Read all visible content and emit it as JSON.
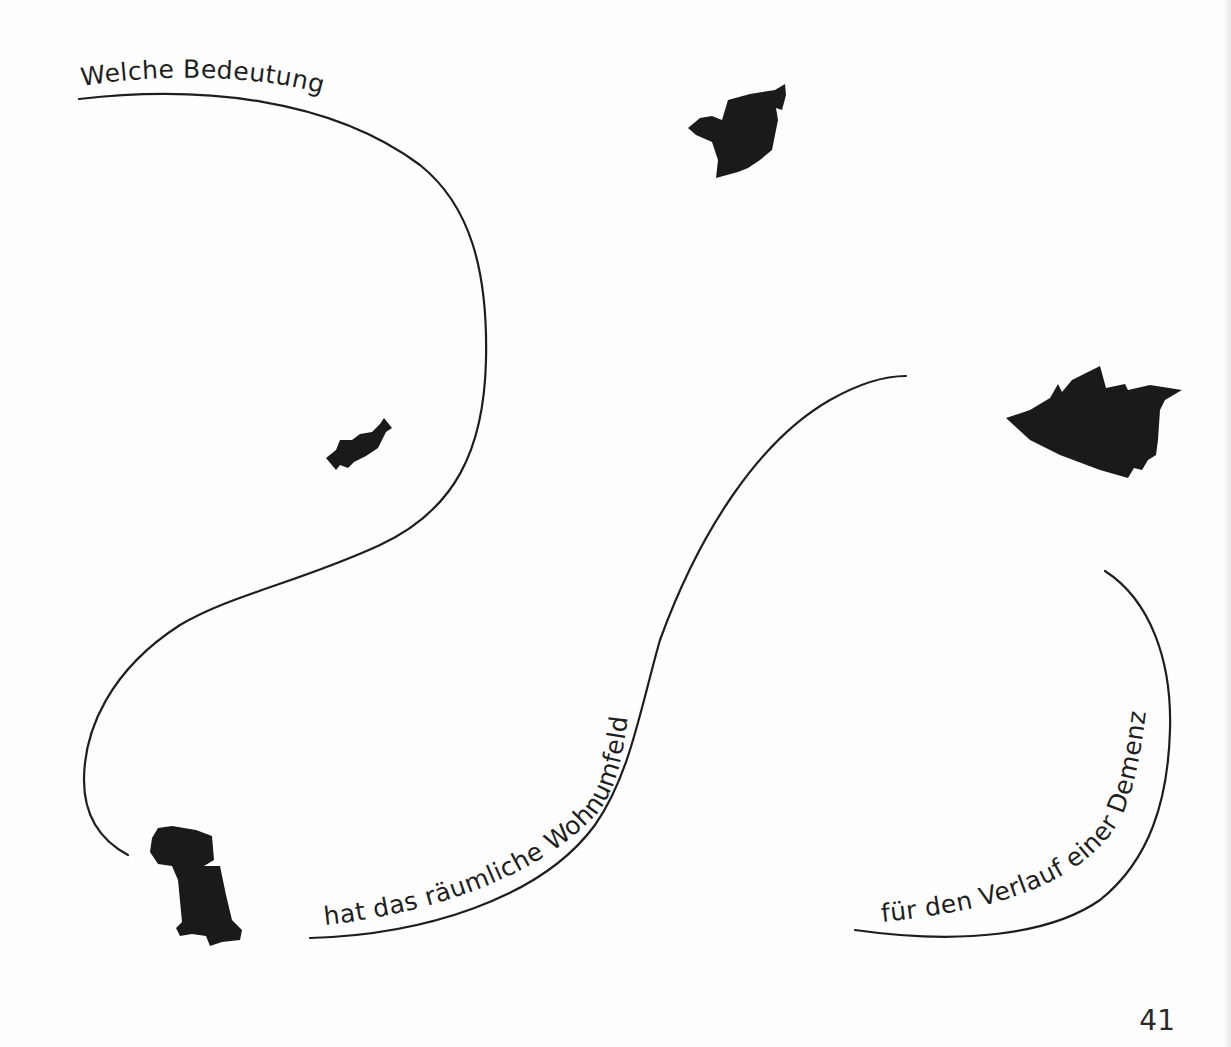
{
  "page": {
    "background": "#fefefe",
    "ink_color": "#1e1e1e",
    "page_number": "41"
  },
  "question": {
    "full_text": "Welche Bedeutung hat das räumliche Wohnumfeld für den Verlauf einer Demenz?",
    "segments": [
      {
        "id": "segment-1",
        "text": "Welche Bedeutung"
      },
      {
        "id": "segment-2",
        "text": "hat das räumliche Wohnumfeld"
      },
      {
        "id": "segment-3",
        "text": "für den Verlauf einer Demenz ?"
      }
    ]
  },
  "decorations": {
    "curves": [
      {
        "id": "curve-1",
        "description": "S-shaped line from top-left sweeping down to bottom-left"
      },
      {
        "id": "curve-2",
        "description": "Rising arc from bottom-center to upper-right"
      },
      {
        "id": "curve-3",
        "description": "Arc on the right from upper-right down to bottom-right"
      }
    ],
    "shapes": [
      {
        "id": "shape-top-center",
        "description": "Black irregular map-like silhouette"
      },
      {
        "id": "shape-right",
        "description": "Large black irregular map-like silhouette"
      },
      {
        "id": "shape-left-small",
        "description": "Small black irregular silhouette"
      },
      {
        "id": "shape-bottom-left",
        "description": "Tall black irregular silhouette"
      }
    ]
  }
}
